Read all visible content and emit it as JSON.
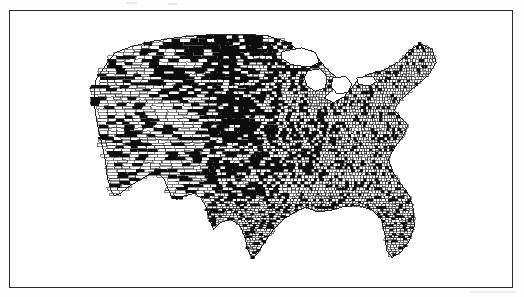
{
  "document": {
    "type": "scanned-figure",
    "page_background": "#fdfdfd",
    "ink_color": "#0d0d0d",
    "paper_color": "#ffffff"
  },
  "frame": {
    "name": "figure-border",
    "x": 9,
    "y": 10,
    "width": 504,
    "height": 278,
    "border_color": "#2b2b2b",
    "border_width": 1.6
  },
  "artifacts": [
    {
      "id": "artifact-a",
      "kind": "scan-speck"
    },
    {
      "id": "artifact-b",
      "kind": "scan-speck"
    },
    {
      "id": "artifact-c",
      "kind": "scan-streak"
    },
    {
      "id": "artifact-d",
      "kind": "scan-fold-line"
    },
    {
      "id": "artifact-e",
      "kind": "scan-fold-line"
    }
  ],
  "chart_data": {
    "type": "map",
    "subtype": "choropleth",
    "title": "",
    "subtitle": "",
    "xlabel": "",
    "ylabel": "",
    "region": "United States (contiguous 48 states)",
    "unit": "county",
    "projection": "albers-usa-like",
    "legend": {
      "visible": false,
      "position": "none",
      "entries": [
        {
          "label": "shaded",
          "color": "#0d0d0d",
          "meaning": "county meets criterion"
        },
        {
          "label": "unshaded",
          "color": "#ffffff",
          "meaning": "county does not meet criterion"
        }
      ]
    },
    "grid": false,
    "axis_visible": false,
    "classes": 2,
    "color_scale": [
      "#ffffff",
      "#0d0d0d"
    ],
    "map_bounds_px": {
      "x0": 88,
      "y0": 28,
      "x1": 444,
      "y1": 268
    },
    "density_note": "county polygons are large and sparse in the West, very small and dense east of the Mississippi",
    "regions": [
      {
        "name": "Pacific Northwest",
        "cx": 0.09,
        "cy": 0.13,
        "fill_share": 0.42,
        "county_scale": 2.5
      },
      {
        "name": "Northern Rockies",
        "cx": 0.24,
        "cy": 0.12,
        "fill_share": 0.55,
        "county_scale": 2.8
      },
      {
        "name": "Northern Plains",
        "cx": 0.42,
        "cy": 0.14,
        "fill_share": 0.72,
        "county_scale": 1.8
      },
      {
        "name": "Upper Midwest",
        "cx": 0.56,
        "cy": 0.17,
        "fill_share": 0.46,
        "county_scale": 1.2
      },
      {
        "name": "Great Lakes",
        "cx": 0.68,
        "cy": 0.25,
        "fill_share": 0.22,
        "county_scale": 0.9
      },
      {
        "name": "New England",
        "cx": 0.92,
        "cy": 0.17,
        "fill_share": 0.18,
        "county_scale": 0.8
      },
      {
        "name": "Mid-Atlantic",
        "cx": 0.85,
        "cy": 0.36,
        "fill_share": 0.2,
        "county_scale": 0.8
      },
      {
        "name": "California",
        "cx": 0.08,
        "cy": 0.47,
        "fill_share": 0.3,
        "county_scale": 2.4
      },
      {
        "name": "Great Basin",
        "cx": 0.22,
        "cy": 0.42,
        "fill_share": 0.34,
        "county_scale": 3.0
      },
      {
        "name": "Central Plains",
        "cx": 0.45,
        "cy": 0.4,
        "fill_share": 0.78,
        "county_scale": 1.5
      },
      {
        "name": "Corn Belt",
        "cx": 0.58,
        "cy": 0.42,
        "fill_share": 0.38,
        "county_scale": 1.0
      },
      {
        "name": "Appalachia",
        "cx": 0.78,
        "cy": 0.5,
        "fill_share": 0.22,
        "county_scale": 0.85
      },
      {
        "name": "Desert Southwest",
        "cx": 0.2,
        "cy": 0.66,
        "fill_share": 0.26,
        "county_scale": 3.2
      },
      {
        "name": "Southern Plains",
        "cx": 0.42,
        "cy": 0.62,
        "fill_share": 0.56,
        "county_scale": 1.4
      },
      {
        "name": "Texas",
        "cx": 0.42,
        "cy": 0.8,
        "fill_share": 0.3,
        "county_scale": 1.0
      },
      {
        "name": "Deep South",
        "cx": 0.68,
        "cy": 0.74,
        "fill_share": 0.24,
        "county_scale": 0.9
      },
      {
        "name": "Florida",
        "cx": 0.86,
        "cy": 0.9,
        "fill_share": 0.28,
        "county_scale": 1.0
      }
    ],
    "summary": {
      "total_counties_drawn": 3100,
      "shaded_fraction_overall": 0.33,
      "shaded_concentration": "Great Plains corridor from the Dakotas through Nebraska and Kansas into west Texas"
    }
  },
  "accessibility": {
    "alt_text": "Black and white map of the contiguous United States divided into counties, with many counties filled solid black, concentrated heavily through the Great Plains and upper Midwest, inside a thin rectangular border."
  }
}
